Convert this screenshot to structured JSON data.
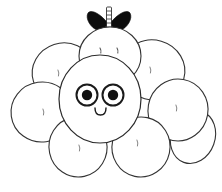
{
  "image": {
    "title": "Berry creature line art",
    "style": "black-and-white coloring-book outline",
    "background_color": "#ffffff",
    "line_color": "#333333",
    "fill_color": "#ffffff",
    "accent_color": "#0d0d0d",
    "width": 222,
    "height": 192
  },
  "subject": {
    "name": "cluster-berry-character",
    "description": "A round cluster of eight petal-like berry lobes with a central smiling face, a smaller berry face on top, and two solid black leaves with a striped stem"
  },
  "outer_lobes": [
    {
      "id": "lobe-top-left",
      "label": "top left lobe",
      "cx": 63,
      "cy": 72,
      "rx": 31,
      "ry": 29,
      "rotate": -18,
      "tick_x": 58,
      "tick_y": 73
    },
    {
      "id": "lobe-top-right",
      "label": "top right lobe",
      "cx": 153,
      "cy": 70,
      "rx": 32,
      "ry": 30,
      "rotate": 16,
      "tick_x": 150,
      "tick_y": 70
    },
    {
      "id": "lobe-left",
      "label": "left lobe",
      "cx": 42,
      "cy": 112,
      "rx": 31,
      "ry": 30,
      "rotate": -8,
      "tick_x": 43,
      "tick_y": 112
    },
    {
      "id": "lobe-right",
      "label": "right lobe",
      "cx": 178,
      "cy": 110,
      "rx": 30,
      "ry": 31,
      "rotate": 10,
      "tick_x": 176,
      "tick_y": 108
    },
    {
      "id": "lobe-bottom-left",
      "label": "bottom left lobe",
      "cx": 78,
      "cy": 147,
      "rx": 29,
      "ry": 30,
      "rotate": -12,
      "tick_x": 79,
      "tick_y": 148
    },
    {
      "id": "lobe-bottom-right",
      "label": "bottom right lobe",
      "cx": 141,
      "cy": 147,
      "rx": 29,
      "ry": 30,
      "rotate": 12,
      "tick_x": 137,
      "tick_y": 143
    },
    {
      "id": "lobe-far-right",
      "label": "far right lobe",
      "cx": 193,
      "cy": 137,
      "rx": 22,
      "ry": 26,
      "rotate": 20,
      "tick_x": 0,
      "tick_y": 0
    },
    {
      "id": "lobe-top-berry",
      "label": "top berry lobe",
      "cx": 110,
      "cy": 55,
      "rx": 31,
      "ry": 30,
      "rotate": 0,
      "tick_x": 0,
      "tick_y": 0
    }
  ],
  "top_berry": {
    "label": "small berry head with dot eyes",
    "cx": 110,
    "cy": 56,
    "rx": 31,
    "ry": 29,
    "eyes": [
      {
        "id": "top-eye-left",
        "x": 101,
        "y": 50
      },
      {
        "id": "top-eye-right",
        "x": 117,
        "y": 50
      }
    ]
  },
  "stem": {
    "label": "striped stem",
    "x": 108,
    "y_top": 7,
    "width": 5,
    "height": 22,
    "rungs": 6
  },
  "leaves": [
    {
      "id": "leaf-left",
      "label": "left black leaf"
    },
    {
      "id": "leaf-right",
      "label": "right black leaf"
    }
  ],
  "face": {
    "label": "central smiling face",
    "body": {
      "cx": 100,
      "cy": 99,
      "rx": 41,
      "ry": 44
    },
    "eyes": [
      {
        "id": "eye-left",
        "cx": 87,
        "cy": 95,
        "r_outer": 10.5,
        "r_pupil": 5.2
      },
      {
        "id": "eye-right",
        "cx": 113,
        "cy": 95,
        "r_outer": 10.5,
        "r_pupil": 5.2
      }
    ],
    "mouth": {
      "id": "smile",
      "path": "M 96 107 q 0 7 5.5 7 q 5.5 0 5.5 -7",
      "shape": "small u-shaped smile"
    }
  }
}
